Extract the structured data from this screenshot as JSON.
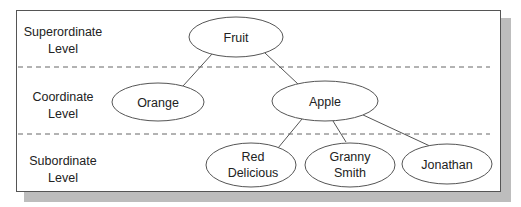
{
  "levels": [
    {
      "line1": "Superordinate",
      "line2": "Level"
    },
    {
      "line1": "Coordinate",
      "line2": "Level"
    },
    {
      "line1": "Subordinate",
      "line2": "Level"
    }
  ],
  "nodes": {
    "fruit": {
      "label": "Fruit"
    },
    "orange": {
      "label": "Orange"
    },
    "apple": {
      "label": "Apple"
    },
    "red_delicious": {
      "line1": "Red",
      "line2": "Delicious"
    },
    "granny_smith": {
      "line1": "Granny",
      "line2": "Smith"
    },
    "jonathan": {
      "label": "Jonathan"
    }
  },
  "edges": [
    [
      "Fruit",
      "Orange"
    ],
    [
      "Fruit",
      "Apple"
    ],
    [
      "Apple",
      "Red Delicious"
    ],
    [
      "Apple",
      "Granny Smith"
    ],
    [
      "Apple",
      "Jonathan"
    ]
  ],
  "colors": {
    "stroke": "#555555",
    "shadow": "#bdbdbd",
    "text": "#222222"
  }
}
